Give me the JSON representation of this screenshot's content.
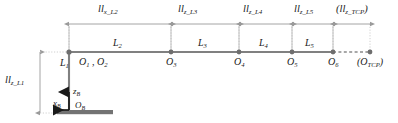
{
  "diagram": {
    "colors": {
      "link": "#808080",
      "joint": "#707070",
      "dimension": "#9a9a9a",
      "extension": "#bdbdbd",
      "base": "#737373",
      "axis": "#1a1a1a",
      "text": "#1a1a1a"
    },
    "dimensions": [
      {
        "id": "ll_x_L2",
        "base": "ll",
        "sub": "x_L2",
        "text": "llx_L2",
        "paren": false
      },
      {
        "id": "ll_z_L3",
        "base": "ll",
        "sub": "z_L3",
        "text": "llz_L3",
        "paren": false
      },
      {
        "id": "ll_z_L4",
        "base": "ll",
        "sub": "z_L4",
        "text": "llz_L4",
        "paren": false
      },
      {
        "id": "ll_z_L5",
        "base": "ll",
        "sub": "z_L5",
        "text": "llz_L5",
        "paren": false
      },
      {
        "id": "ll_z_TCP",
        "base": "ll",
        "sub": "z_TCP",
        "text": "(llz_TCP)",
        "paren": true
      },
      {
        "id": "ll_z_L1",
        "base": "ll",
        "sub": "z_L1",
        "text": "llz_L1",
        "paren": false,
        "orientation": "vertical"
      }
    ],
    "links": [
      {
        "id": "L1",
        "base": "L",
        "sub": "1"
      },
      {
        "id": "L2",
        "base": "L",
        "sub": "2"
      },
      {
        "id": "L3",
        "base": "L",
        "sub": "3"
      },
      {
        "id": "L4",
        "base": "L",
        "sub": "4"
      },
      {
        "id": "L5",
        "base": "L",
        "sub": "5"
      }
    ],
    "joints": [
      {
        "id": "O1_O2",
        "base": "O",
        "sub": "1",
        "base2": "O",
        "sub2": "2",
        "combined": true
      },
      {
        "id": "O3",
        "base": "O",
        "sub": "3"
      },
      {
        "id": "O4",
        "base": "O",
        "sub": "4"
      },
      {
        "id": "O5",
        "base": "O",
        "sub": "5"
      },
      {
        "id": "O6",
        "base": "O",
        "sub": "6"
      },
      {
        "id": "O_TCP",
        "base": "O",
        "sub": "TCP",
        "paren": true
      }
    ],
    "base_frame": {
      "origin": {
        "base": "O",
        "sub": "B"
      },
      "axis_z": {
        "base": "z",
        "sub": "B"
      },
      "axis_x": {
        "base": "x",
        "sub": "B"
      }
    },
    "labels": {
      "ll_x_L2_base": "ll",
      "ll_x_L2_sub": "x_L2",
      "ll_z_L3_base": "ll",
      "ll_z_L3_sub": "z_L3",
      "ll_z_L4_base": "ll",
      "ll_z_L4_sub": "z_L4",
      "ll_z_L5_base": "ll",
      "ll_z_L5_sub": "z_L5",
      "ll_z_TCP_open": "(",
      "ll_z_TCP_base": "ll",
      "ll_z_TCP_sub": "z_TCP",
      "ll_z_TCP_close": ")",
      "ll_z_L1_base": "ll",
      "ll_z_L1_sub": "z_L1",
      "L1_base": "L",
      "L1_sub": "1",
      "L2_base": "L",
      "L2_sub": "2",
      "L3_base": "L",
      "L3_sub": "3",
      "L4_base": "L",
      "L4_sub": "4",
      "L5_base": "L",
      "L5_sub": "5",
      "O1_base": "O",
      "O1_sub": "1",
      "O_comma": " , ",
      "O2_base": "O",
      "O2_sub": "2",
      "O3_base": "O",
      "O3_sub": "3",
      "O4_base": "O",
      "O4_sub": "4",
      "O5_base": "O",
      "O5_sub": "5",
      "O6_base": "O",
      "O6_sub": "6",
      "OTCP_open": "(",
      "OTCP_base": "O",
      "OTCP_sub": "TCP",
      "OTCP_close": ")",
      "zB_base": "z",
      "zB_sub": "B",
      "xB_base": "x",
      "xB_sub": "B",
      "OB_base": "O",
      "OB_sub": "B"
    }
  }
}
